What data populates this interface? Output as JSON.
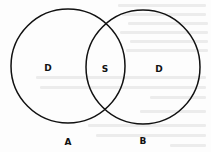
{
  "diagram": {
    "type": "venn",
    "sets": [
      {
        "id": "A",
        "label": "A",
        "region_label": "D",
        "center": [
          68,
          66
        ],
        "radius": 57
      },
      {
        "id": "B",
        "label": "B",
        "region_label": "D",
        "center": [
          143,
          67
        ],
        "radius": 57
      }
    ],
    "intersection": {
      "label": "S",
      "sets": [
        "A",
        "B"
      ]
    },
    "labels": {
      "set_a": "A",
      "set_b": "B",
      "a_only": "D",
      "b_only": "D",
      "overlap": "S"
    },
    "colors": {
      "stroke": "#111111",
      "background": "#fdfdfd",
      "show_through": "#ececec"
    },
    "stroke_width": 1.5
  }
}
